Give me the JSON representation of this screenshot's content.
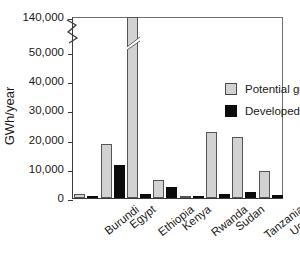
{
  "chart_data": {
    "type": "bar",
    "title": "",
    "xlabel": "",
    "ylabel": "GWh/year",
    "categories": [
      "Burundi",
      "Egypt",
      "Ethiopia",
      "Kenya",
      "Rwanda",
      "Sudan",
      "Tanzania",
      "Uganda"
    ],
    "series": [
      {
        "name": "Potential generation",
        "color": "#d2d2d2",
        "values": [
          1500,
          18500,
          140000,
          6300,
          420,
          22500,
          21000,
          9400
        ]
      },
      {
        "name": "Developed generation",
        "color": "#0b0b0b",
        "values": [
          500,
          11300,
          1400,
          3700,
          40,
          1500,
          2000,
          1200
        ]
      }
    ],
    "ylim": [
      0,
      50000
    ],
    "yticks": [
      0,
      10000,
      20000,
      30000,
      40000,
      50000,
      140000
    ],
    "ytick_labels": [
      "0",
      "10,000",
      "20,000",
      "30,000",
      "40,000",
      "50,000",
      "140,000"
    ],
    "axis_break": {
      "present": true,
      "below": 50000,
      "above": 140000,
      "note": "y-axis broken between 50,000 and 140,000"
    },
    "grid": false,
    "legend_position": "upper center"
  },
  "legend": {
    "items": [
      {
        "label": "Potential generation"
      },
      {
        "label": "Developed generation"
      }
    ]
  }
}
